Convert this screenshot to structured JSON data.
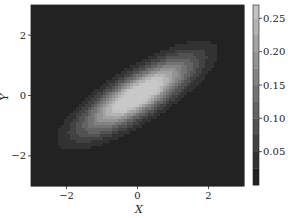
{
  "chart_data": {
    "type": "contourf",
    "title": "",
    "xlabel": "X",
    "ylabel": "Y",
    "xlim": [
      -3,
      3
    ],
    "ylim": [
      -3,
      3
    ],
    "x_ticks": [
      -2,
      0,
      2
    ],
    "y_ticks": [
      -2,
      0,
      2
    ],
    "x_tick_labels": [
      "−2",
      "0",
      "2"
    ],
    "y_tick_labels": [
      "−2",
      "0",
      "2"
    ],
    "grid": false,
    "colormap": "gray",
    "distribution": {
      "kind": "bivariate_normal",
      "mean": [
        0,
        0
      ],
      "std_x": 1.0,
      "std_y": 0.8,
      "correlation": 0.8,
      "peak_value": 0.27
    },
    "levels": [
      0.0,
      0.025,
      0.05,
      0.075,
      0.1,
      0.125,
      0.15,
      0.175,
      0.2,
      0.225,
      0.25,
      0.275
    ],
    "colorbar": {
      "ticks": [
        0.05,
        0.1,
        0.15,
        0.2,
        0.25
      ],
      "tick_labels": [
        "0.05",
        "0.10",
        "0.15",
        "0.20",
        "0.25"
      ],
      "range": [
        0.0,
        0.27
      ],
      "position": "right"
    }
  },
  "colors": {
    "low": "#1a1a1a",
    "high": "#c8c8c8",
    "axis": "#222222",
    "background": "#ffffff"
  }
}
